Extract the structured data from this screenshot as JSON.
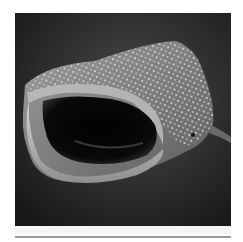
{
  "image": {
    "subject": "Whale shark head with open mouth, black-and-white photograph",
    "alt": "Black-and-white photograph of a whale shark facing the viewer with its mouth wide open",
    "palette": {
      "background": "#ffffff",
      "water_dark": "#1c1c1c",
      "water_mid": "#333333",
      "skin_light": "#c8c8c8",
      "skin_mid": "#8a8a8a",
      "mouth_interior": "#050505",
      "rule": "#9a9a9a"
    }
  }
}
